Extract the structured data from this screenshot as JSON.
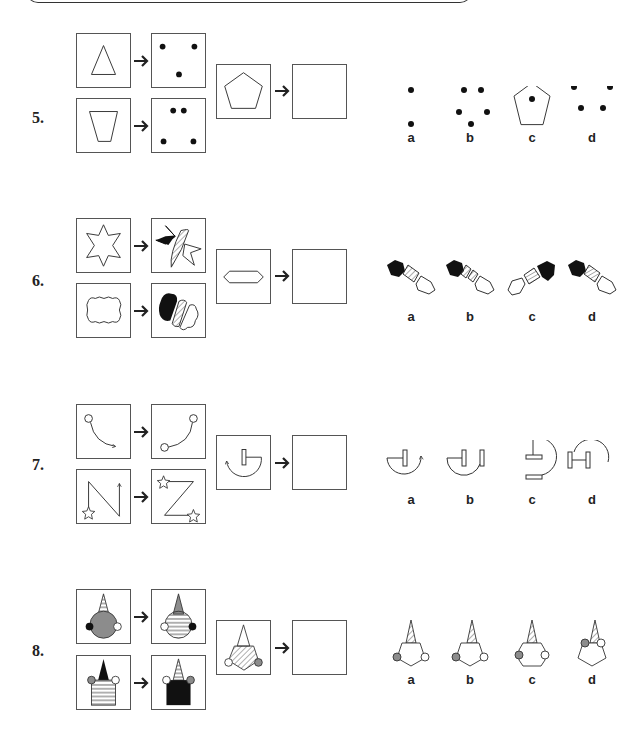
{
  "questions": [
    {
      "number": "5.",
      "pairs": [
        {
          "from": "triangle",
          "to": "three-dots"
        },
        {
          "from": "trapezoid",
          "to": "four-dots"
        }
      ],
      "prompt": "pentagon",
      "options": [
        {
          "label": "a",
          "content": "two-dots"
        },
        {
          "label": "b",
          "content": "five-dots"
        },
        {
          "label": "c",
          "content": "pentagon-with-dot"
        },
        {
          "label": "d",
          "content": "five-dots-pentagon-arrangement"
        }
      ]
    },
    {
      "number": "6.",
      "pairs": [
        {
          "from": "six-point-star",
          "to": "split-star-black-hatched-white"
        },
        {
          "from": "cloud",
          "to": "split-cloud-black-hatched-white"
        }
      ],
      "prompt": "elongated-hexagon",
      "options": [
        {
          "label": "a",
          "content": "split-hexagon-black-hatched-white"
        },
        {
          "label": "b",
          "content": "split-hexagon-black-two-hatched-white"
        },
        {
          "label": "c",
          "content": "split-hexagon-white-hatched-black"
        },
        {
          "label": "d",
          "content": "split-hexagon-black-vertical-hatched-white"
        }
      ]
    },
    {
      "number": "7.",
      "pairs": [
        {
          "from": "curved-arrow-with-circle",
          "to": "curve-two-circles"
        },
        {
          "from": "n-path-with-star-arrow",
          "to": "z-path-two-stars"
        }
      ],
      "prompt": "semicircle-arrow-with-bar",
      "options": [
        {
          "label": "a",
          "content": "semicircle-arrow-bar-mirrored"
        },
        {
          "label": "b",
          "content": "semicircle-two-bars"
        },
        {
          "label": "c",
          "content": "semicircle-two-horizontal-bars"
        },
        {
          "label": "d",
          "content": "arc-h-bars"
        }
      ]
    },
    {
      "number": "8.",
      "pairs": [
        {
          "from": "grey-head-striped-hat",
          "to": "striped-head-grey-hat"
        },
        {
          "from": "striped-square-black-hat",
          "to": "black-square-striped-hat"
        }
      ],
      "prompt": "hatched-pentagon-white-hat",
      "options": [
        {
          "label": "a",
          "content": "white-pentagon-hatched-hat"
        },
        {
          "label": "b",
          "content": "white-pentagon-hatched-hat-b"
        },
        {
          "label": "c",
          "content": "white-hexagon-hatched-hat"
        },
        {
          "label": "d",
          "content": "white-pentagon-high-circles"
        }
      ]
    }
  ],
  "colors": {
    "stroke": "#333333",
    "grey_fill": "#8c8c8c",
    "black_fill": "#111111"
  }
}
